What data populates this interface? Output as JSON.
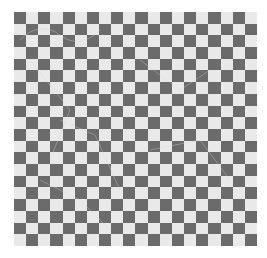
{
  "image": {
    "subject": "checkerboard pattern",
    "rows": 20,
    "columns": 20,
    "top_left_color": "dark",
    "colors": {
      "dark": "#6b6b6b",
      "light": "#e9e9e9",
      "background": "#ffffff",
      "sketch_lines": "#cfcfcf"
    }
  }
}
